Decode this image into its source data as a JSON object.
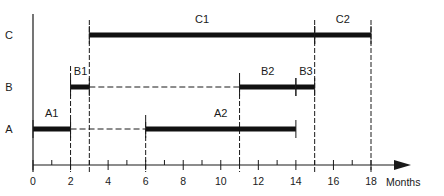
{
  "chart_data": {
    "type": "gantt",
    "title": "",
    "xlabel": "Months",
    "ylabel": "",
    "xlim": [
      0,
      18
    ],
    "x_ticks": [
      0,
      2,
      4,
      6,
      8,
      10,
      12,
      14,
      16,
      18
    ],
    "x_minor_ticks": [
      1,
      3,
      5,
      7,
      9,
      11,
      13,
      15,
      17
    ],
    "rows": [
      "A",
      "B",
      "C"
    ],
    "tasks": [
      {
        "name": "A1",
        "row": "A",
        "start": 0,
        "end": 2
      },
      {
        "name": "A2",
        "row": "A",
        "start": 6,
        "end": 14
      },
      {
        "name": "B1",
        "row": "B",
        "start": 2,
        "end": 3
      },
      {
        "name": "B2",
        "row": "B",
        "start": 11,
        "end": 14
      },
      {
        "name": "B3",
        "row": "B",
        "start": 14,
        "end": 15
      },
      {
        "name": "C1",
        "row": "C",
        "start": 3,
        "end": 15
      },
      {
        "name": "C2",
        "row": "C",
        "start": 15,
        "end": 18
      }
    ],
    "dashed_connectors": [
      {
        "row": "A",
        "start": 2,
        "end": 6
      },
      {
        "row": "B",
        "start": 3,
        "end": 11
      }
    ],
    "dashed_verticals": [
      2,
      3,
      6,
      11,
      15,
      18
    ],
    "colors": {
      "ink": "#1a1a1a",
      "bar": "#111111"
    }
  }
}
